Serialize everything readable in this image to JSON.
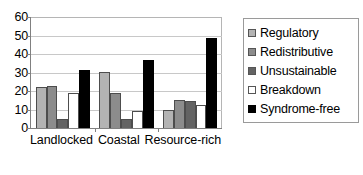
{
  "chart_data": {
    "type": "bar",
    "title": "",
    "xlabel": "",
    "ylabel": "",
    "ylim": [
      0,
      60
    ],
    "yticks": [
      0,
      10,
      20,
      30,
      40,
      50,
      60
    ],
    "grid": true,
    "legend_position": "right",
    "categories": [
      "Landlocked",
      "Coastal",
      "Resource-rich"
    ],
    "series": [
      {
        "name": "Regulatory",
        "color": "#b3b3b3",
        "values": [
          22,
          30.5,
          9.5
        ]
      },
      {
        "name": "Redistributive",
        "color": "#8c8c8c",
        "values": [
          22.5,
          19,
          15
        ]
      },
      {
        "name": "Unsustainable",
        "color": "#636363",
        "values": [
          5,
          5,
          14.5
        ]
      },
      {
        "name": "Breakdown",
        "color": "#ffffff",
        "values": [
          19,
          9,
          12.5
        ]
      },
      {
        "name": "Syndrome-free",
        "color": "#000000",
        "values": [
          31.5,
          36.5,
          48.5
        ]
      }
    ]
  }
}
